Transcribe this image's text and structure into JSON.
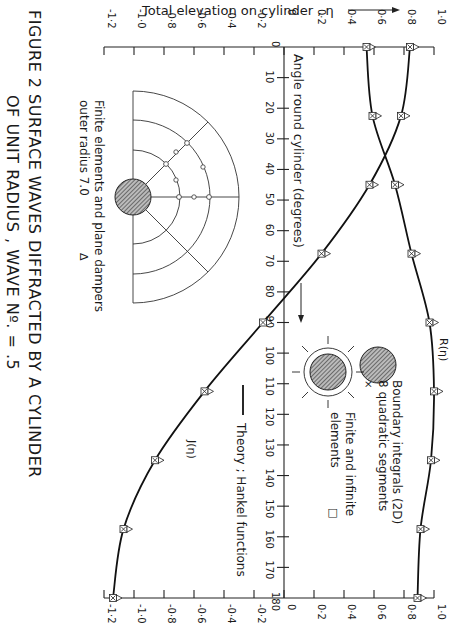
{
  "chart_data": {
    "type": "line",
    "orientation": "rotated 90 degrees clockwise (angle axis runs top-to-bottom, elevation axis runs left-to-right)",
    "title": "FIGURE 2   SURFACE   WAVES   DIFFRACTED   BY A CYLINDER",
    "subtitle": "OF UNIT RADIUS , WAVE Nº. = .5",
    "xlabel": "Angle round cylinder (degrees)",
    "ylabel": "Total elevation on cylinder , η",
    "xlim": [
      0,
      180
    ],
    "ylim": [
      -1.2,
      1.0
    ],
    "x_ticks": [
      0,
      10,
      20,
      30,
      40,
      50,
      60,
      70,
      80,
      90,
      100,
      110,
      120,
      130,
      140,
      150,
      160,
      170,
      180
    ],
    "y_ticks": [
      -1.2,
      -1.0,
      -0.8,
      -0.6,
      -0.4,
      -0.2,
      0,
      0.2,
      0.4,
      0.6,
      0.8,
      1.0
    ],
    "y_tick_labels": [
      "-1·2",
      "-1·0",
      "-0·8",
      "-0·6",
      "-0·4",
      "-0·2",
      "0",
      "0·2",
      "0·4",
      "0·6",
      "0·8",
      "1·0"
    ],
    "grid": false,
    "x": [
      0,
      22.5,
      45,
      67.5,
      90,
      112.5,
      135,
      157.5,
      180
    ],
    "series": [
      {
        "name": "R(η)",
        "values": [
          0.55,
          0.59,
          0.74,
          0.85,
          0.97,
          1.0,
          0.98,
          0.91,
          0.89
        ]
      },
      {
        "name": "J(η)",
        "values": [
          0.84,
          0.78,
          0.57,
          0.25,
          -0.14,
          -0.53,
          -0.86,
          -1.07,
          -1.14
        ]
      }
    ],
    "curve_labels": {
      "R": "R(η)",
      "J": "J(η)"
    },
    "legend": [
      {
        "label": "Theory ; Hankel functions",
        "marker": "solid line"
      },
      {
        "label": "Boundary integrals (2D) 8 quadratic segments",
        "marker": "×"
      },
      {
        "label": "Finite and infinite elements",
        "marker": "□"
      },
      {
        "label": "Finite elements and plane dampers outer radius 7.0",
        "marker": "△"
      }
    ]
  },
  "labels": {
    "ylabel": "Total elevation on cylinder , η",
    "xlabel": "Angle round cylinder (degrees)",
    "caption_line1": "FIGURE 2   SURFACE   WAVES   DIFFRACTED   BY A CYLINDER",
    "caption_line2": "OF UNIT RADIUS ,  WAVE  Nº. = .5",
    "r_label": "R(η)",
    "j_label": "J(η)",
    "legend_bi_1": "Boundary integrals (2D)",
    "legend_bi_2": "8 quadratic segments",
    "legend_bi_marker": "×",
    "legend_fie_1": "Finite and infinite",
    "legend_fie_2": "elements",
    "legend_fie_marker": "□",
    "legend_theory": "Theory ; Hankel functions",
    "inset_1": "Finite elements and plane dampers",
    "inset_2": "outer radius   7.0",
    "inset_marker": "Δ"
  }
}
